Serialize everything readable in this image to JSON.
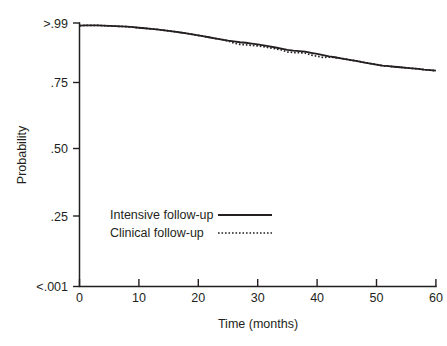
{
  "chart_data": {
    "type": "line",
    "title": "",
    "subtitle": "",
    "xlabel": "Time (months)",
    "ylabel": "Probability",
    "xlim": [
      0,
      60
    ],
    "ylim": [
      0,
      1
    ],
    "grid": false,
    "legend_position": "inside-lower-left",
    "x_ticks": [
      0,
      10,
      20,
      30,
      40,
      50,
      60
    ],
    "x_tick_labels": [
      "0",
      "10",
      "20",
      "30",
      "40",
      "50",
      "60"
    ],
    "y_ticks": [
      1.0,
      0.75,
      0.5,
      0.25,
      0.0
    ],
    "y_tick_labels": [
      ">.99",
      ".75",
      ".50",
      ".25",
      "<.001"
    ],
    "series": [
      {
        "name": "Intensive follow-up",
        "style": "solid",
        "color": "#231f20",
        "x": [
          0,
          1,
          2,
          3,
          4,
          5,
          6,
          7,
          8,
          9,
          10,
          11,
          12,
          13,
          14,
          15,
          16,
          17,
          18,
          19,
          20,
          21,
          22,
          23,
          24,
          25,
          26,
          27,
          28,
          29,
          30,
          31,
          32,
          33,
          34,
          35,
          36,
          37,
          38,
          39,
          40,
          41,
          42,
          43,
          44,
          45,
          46,
          47,
          48,
          49,
          50,
          51,
          52,
          53,
          54,
          55,
          56,
          57,
          58,
          59,
          60
        ],
        "values": [
          0.99,
          0.991,
          0.991,
          0.991,
          0.99,
          0.989,
          0.988,
          0.987,
          0.986,
          0.984,
          0.982,
          0.98,
          0.978,
          0.976,
          0.973,
          0.97,
          0.967,
          0.964,
          0.961,
          0.957,
          0.953,
          0.949,
          0.945,
          0.941,
          0.937,
          0.933,
          0.93,
          0.927,
          0.925,
          0.922,
          0.919,
          0.915,
          0.911,
          0.907,
          0.903,
          0.898,
          0.895,
          0.893,
          0.891,
          0.887,
          0.883,
          0.878,
          0.873,
          0.87,
          0.866,
          0.862,
          0.858,
          0.854,
          0.85,
          0.846,
          0.842,
          0.838,
          0.836,
          0.834,
          0.832,
          0.83,
          0.828,
          0.826,
          0.823,
          0.821,
          0.819
        ]
      },
      {
        "name": "Clinical follow-up",
        "style": "dotted",
        "color": "#231f20",
        "x": [
          0,
          1,
          2,
          3,
          4,
          5,
          6,
          7,
          8,
          9,
          10,
          11,
          12,
          13,
          14,
          15,
          16,
          17,
          18,
          19,
          20,
          21,
          22,
          23,
          24,
          25,
          26,
          27,
          28,
          29,
          30,
          31,
          32,
          33,
          34,
          35,
          36,
          37,
          38,
          39,
          40,
          41,
          42,
          43,
          44,
          45,
          46,
          47,
          48,
          49,
          50,
          51,
          52,
          53,
          54,
          55,
          56,
          57,
          58,
          59,
          60
        ],
        "values": [
          0.99,
          0.991,
          0.991,
          0.991,
          0.99,
          0.989,
          0.988,
          0.987,
          0.986,
          0.984,
          0.982,
          0.98,
          0.978,
          0.976,
          0.973,
          0.97,
          0.967,
          0.964,
          0.961,
          0.957,
          0.953,
          0.949,
          0.945,
          0.941,
          0.937,
          0.932,
          0.924,
          0.919,
          0.917,
          0.915,
          0.913,
          0.91,
          0.906,
          0.902,
          0.898,
          0.89,
          0.888,
          0.887,
          0.886,
          0.878,
          0.874,
          0.869,
          0.871,
          0.869,
          0.866,
          0.862,
          0.858,
          0.854,
          0.85,
          0.846,
          0.842,
          0.838,
          0.836,
          0.834,
          0.832,
          0.83,
          0.828,
          0.826,
          0.823,
          0.821,
          0.819
        ]
      }
    ],
    "annotations": []
  },
  "legend": {
    "entries": [
      {
        "label": "Intensive follow-up",
        "style": "solid"
      },
      {
        "label": "Clinical follow-up",
        "style": "dotted"
      }
    ]
  },
  "colors": {
    "ink": "#231f20",
    "background": "#ffffff"
  }
}
